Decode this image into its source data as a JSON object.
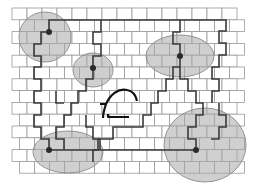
{
  "diagram": {
    "title": "",
    "colors": {
      "background": "#ffffff",
      "brick_outline": "#9a9a9a",
      "zone_fill": "#a8a8a8",
      "crack": "#3a3a3a",
      "crack_bold": "#111111",
      "node": "#2a2a2a"
    },
    "wall": {
      "x0": 12,
      "y0": 8,
      "rows": 14,
      "row_height": 11.8,
      "brick_width": 15,
      "x_end": 247,
      "row_offset": 7.5
    },
    "zones": [
      {
        "id": "zone-top-left",
        "cx": 45,
        "cy": 37,
        "rx": 26,
        "ry": 25,
        "node": [
          49,
          32
        ]
      },
      {
        "id": "zone-center-small",
        "cx": 93,
        "cy": 70,
        "rx": 20,
        "ry": 17,
        "node": [
          93,
          68
        ]
      },
      {
        "id": "zone-top-right",
        "cx": 180,
        "cy": 56,
        "rx": 34,
        "ry": 21,
        "node": [
          180,
          56
        ]
      },
      {
        "id": "zone-bottom-left",
        "cx": 68,
        "cy": 152,
        "rx": 35,
        "ry": 21,
        "node": [
          49,
          150
        ]
      },
      {
        "id": "zone-bottom-right",
        "cx": 205,
        "cy": 145,
        "rx": 41,
        "ry": 37,
        "node": [
          196,
          150
        ]
      }
    ],
    "cracks": [
      {
        "id": "crack-top-horizontal",
        "points": "49,32 49,20 226,20 226,31 219,31 219,43 226,43 226,55 219,55 219,67 212,67 212,79 219,79 219,91 212,91 212,103"
      },
      {
        "id": "crack-left-outer",
        "points": "49,32 41,32 41,44 34,44 34,56 41,56 41,67 34,67 34,79 41,79 41,91 34,91 34,103 41,103 41,115 34,115 34,127 41,127 41,139 49,139 49,150"
      },
      {
        "id": "crack-left-inner",
        "points": "93,68 93,79 86,79 86,91 78,91 78,103 71,103 71,115 64,115 64,127 56,127 56,139 64,139 64,150"
      },
      {
        "id": "crack-center-upper",
        "points": "93,68 93,56 101,56 101,44 93,44 93,32 101,32 101,20"
      },
      {
        "id": "crack-top-right-down",
        "points": "180,56 180,44 173,44 173,32 180,32 180,20"
      },
      {
        "id": "crack-right-to-center",
        "points": "180,56 180,67 173,67 173,79 166,79 166,91 158,91 158,103 151,103 151,115 143,115 143,127 128,127 120,127 113,127 113,139 98,139 98,150 93,150 93,162"
      },
      {
        "id": "crack-bottom-horizontal",
        "points": "49,150 196,150"
      },
      {
        "id": "crack-bottom-right-up",
        "points": "196,150 196,139 188,139 188,127 196,127 196,115 203,115 203,103 196,103 196,91 188,91 188,79 180,79 180,67"
      },
      {
        "id": "crack-bottom-right-lower",
        "points": "219,103 219,115 226,115 226,127 219,127 219,139 211,139"
      },
      {
        "id": "crack-bottom-left-inner",
        "points": "86,115 86,127 93,127 93,139 100,139 100,150"
      },
      {
        "id": "crack-mid-left-vertical",
        "points": "56,91 56,103 64,103"
      }
    ],
    "bold_cracks": [
      {
        "id": "bold-crack-curve",
        "d": "M 106 104 C 110 95, 118 88, 127 90 C 133 91, 136 96, 137 101"
      },
      {
        "id": "bold-crack-hook",
        "d": "M 100 104 L 106 104 C 104 110, 103 114, 103 118"
      },
      {
        "id": "bold-crack-step",
        "d": "M 108 114 L 108 117 L 129 117"
      }
    ]
  }
}
